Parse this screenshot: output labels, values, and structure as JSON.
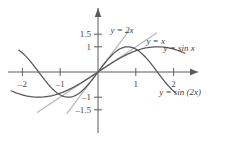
{
  "chart_data": {
    "type": "line",
    "title": "",
    "xlabel": "",
    "ylabel": "",
    "xlim": [
      -2.35,
      2.35
    ],
    "ylim": [
      -1.75,
      1.75
    ],
    "grid": false,
    "legend_position": "inline-annotations",
    "x_ticks": [
      {
        "value": -2,
        "label": "–2"
      },
      {
        "value": -1,
        "label": "–1"
      },
      {
        "value": 1,
        "label": "1"
      },
      {
        "value": 2,
        "label": "2"
      }
    ],
    "y_ticks": [
      {
        "value": 1.5,
        "label": "1.5"
      },
      {
        "value": 1,
        "label": "1"
      },
      {
        "value": -1,
        "label": "–1"
      },
      {
        "value": -1.5,
        "label": "–1.5"
      }
    ],
    "series": [
      {
        "name": "y = 2x",
        "label": "y = 2x",
        "kind": "line",
        "color": "#b9b9b9",
        "domain": [
          -0.82,
          0.82
        ],
        "expression": "2*x",
        "points_x": [
          -0.82,
          -0.41,
          0,
          0.41,
          0.82
        ],
        "points_y": [
          -1.64,
          -0.82,
          0,
          0.82,
          1.64
        ]
      },
      {
        "name": "y = x",
        "label": "y = x",
        "kind": "line",
        "color": "#b9b9b9",
        "domain": [
          -1.6,
          1.55
        ],
        "expression": "x",
        "points_x": [
          -1.6,
          -0.8,
          0,
          0.8,
          1.55
        ],
        "points_y": [
          -1.6,
          -0.8,
          0,
          0.8,
          1.55
        ]
      },
      {
        "name": "y = sin x",
        "label": "y = sin x",
        "kind": "curve",
        "color": "#575757",
        "domain": [
          -2.3,
          2.3
        ],
        "expression": "sin(x)",
        "points_x": [
          -2.3,
          -2.0,
          -1.5708,
          -1.0,
          -0.5,
          0,
          0.5,
          1.0,
          1.5708,
          2.0,
          2.3
        ],
        "points_y": [
          -0.7457,
          -0.9093,
          -1.0,
          -0.8415,
          -0.4794,
          0,
          0.4794,
          0.8415,
          1.0,
          0.9093,
          0.7457
        ]
      },
      {
        "name": "y = sin (2x)",
        "label": "y = sin (2x)",
        "kind": "curve",
        "color": "#575757",
        "domain": [
          -2.1,
          2.05
        ],
        "expression": "sin(2*x)",
        "points_x": [
          -2.1,
          -1.5708,
          -1.0,
          -0.7854,
          -0.5,
          0,
          0.5,
          0.7854,
          1.0,
          1.5708,
          2.05
        ],
        "points_y": [
          0.8716,
          0.0,
          -0.9093,
          -1.0,
          -0.8415,
          0,
          0.8415,
          1.0,
          0.9093,
          0.0,
          -0.8987
        ]
      }
    ],
    "annotations": [
      {
        "text": "y = 2x",
        "x": 0.33,
        "y": 1.53
      },
      {
        "text": "y = x",
        "x": 1.28,
        "y": 1.12
      },
      {
        "text": "y = sin x",
        "x": 1.73,
        "y": 0.82
      },
      {
        "text": "y = sin (2x)",
        "x": 1.62,
        "y": -0.92
      }
    ]
  },
  "axes": {
    "x_axis_name": "x-axis",
    "y_axis_name": "y-axis",
    "arrow_x": "right",
    "arrow_y": "up"
  }
}
